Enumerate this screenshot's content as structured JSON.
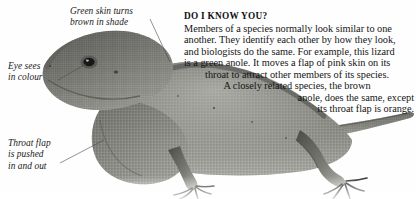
{
  "page": {
    "background_color": "#fefefe",
    "text_color": "#151515"
  },
  "photo": {
    "subject": "green anole lizard",
    "alt": "Side view photograph of a green anole lizard with its head at upper left, extended throat flap (dewlap) below the head, and its body and tail stretching to the right across the lower half of the page",
    "tone": "grayscale"
  },
  "callouts": [
    {
      "id": "skin",
      "name": "callout-green-skin",
      "text": "Green skin turns\nbrown in shade"
    },
    {
      "id": "eye",
      "name": "callout-eye",
      "text": "Eye sees\nin colour"
    },
    {
      "id": "flap",
      "name": "callout-throat-flap",
      "text": "Throat flap\nis pushed\nin and out"
    }
  ],
  "article": {
    "heading": "DO I KNOW YOU?",
    "lines": [
      "Members of a species normally look similar to one",
      "another. They identify each other by how they look,",
      "and biologists do the same. For example, this lizard",
      "is a green anole. It moves a flap of pink skin on its",
      "throat to attract other members of its species.",
      "A closely related species, the brown",
      "anole, does the same, except",
      "its throat flap is orange."
    ]
  }
}
